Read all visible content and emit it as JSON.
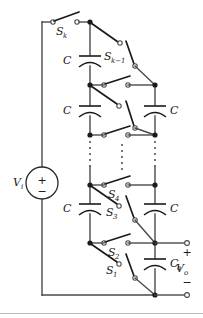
{
  "figure": {
    "type": "circuit-diagram"
  },
  "colors": {
    "wire": "#4a4a4a",
    "blade": "#1a1a1a",
    "node": "#1a1a1a",
    "background": "#ffffff"
  },
  "source": {
    "label": "V",
    "label_sub": "i",
    "plus": "+",
    "minus": "−"
  },
  "switches": {
    "sk": {
      "label": "S",
      "sub": "k"
    },
    "sk_minus_1": {
      "label": "S",
      "sub": "k−1"
    },
    "s4": {
      "label": "S",
      "sub": "4"
    },
    "s3": {
      "label": "S",
      "sub": "3"
    },
    "s2": {
      "label": "S",
      "sub": "2"
    },
    "s1": {
      "label": "S",
      "sub": "1"
    }
  },
  "capacitors": {
    "c_left_top": {
      "label": "C"
    },
    "c_left_mid": {
      "label": "C"
    },
    "c_left_lower": {
      "label": "C"
    },
    "c_right_upper": {
      "label": "C"
    },
    "c_right_lower": {
      "label": "C"
    },
    "c_out": {
      "label": "C",
      "sub": "o"
    }
  },
  "output": {
    "label": "V",
    "label_sub": "o",
    "plus": "+",
    "minus": "−"
  },
  "ellipsis": {
    "marker": "vertical-dotted-continuation",
    "count": 3
  }
}
